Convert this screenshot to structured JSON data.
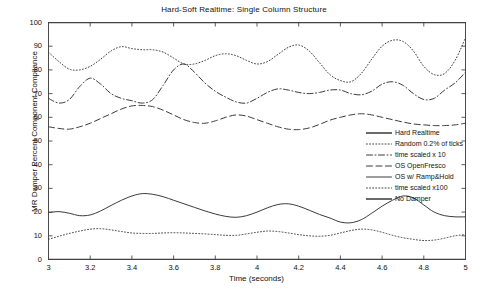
{
  "chart_data": {
    "type": "line",
    "title": "Hard-Soft Realtime: Single Column Structure",
    "xlabel": "Time (seconds)",
    "ylabel": "MR Damper Percent Component Compliance",
    "xlim": [
      3,
      5
    ],
    "ylim": [
      0,
      100
    ],
    "xticks": [
      "3",
      "3.2",
      "3.4",
      "3.6",
      "3.8",
      "4",
      "4.2",
      "4.4",
      "4.6",
      "4.8",
      "5"
    ],
    "xtick_values": [
      3,
      3.2,
      3.4,
      3.6,
      3.8,
      4,
      4.2,
      4.4,
      4.6,
      4.8,
      5
    ],
    "yticks": [
      "0",
      "10",
      "20",
      "30",
      "40",
      "50",
      "60",
      "70",
      "80",
      "90",
      "100"
    ],
    "ytick_values": [
      0,
      10,
      20,
      30,
      40,
      50,
      60,
      70,
      80,
      90,
      100
    ],
    "grid": false,
    "legend_position": "center-right",
    "x": [
      3.0,
      3.05,
      3.1,
      3.15,
      3.2,
      3.25,
      3.3,
      3.35,
      3.4,
      3.45,
      3.5,
      3.55,
      3.6,
      3.65,
      3.7,
      3.75,
      3.8,
      3.85,
      3.9,
      3.95,
      4.0,
      4.05,
      4.1,
      4.15,
      4.2,
      4.25,
      4.3,
      4.35,
      4.4,
      4.45,
      4.5,
      4.55,
      4.6,
      4.65,
      4.7,
      4.75,
      4.8,
      4.85,
      4.9,
      4.95,
      5.0
    ],
    "series": [
      {
        "name": "Hard Realtime",
        "style": "solid",
        "width": 1.6,
        "color": "#3a3a3a",
        "values": [
          100,
          100,
          100,
          100,
          100,
          100,
          100,
          100,
          100,
          100,
          100,
          100,
          100,
          100,
          100,
          100,
          100,
          100,
          100,
          100,
          100,
          100,
          100,
          100,
          100,
          100,
          100,
          100,
          100,
          100,
          100,
          100,
          100,
          100,
          100,
          100,
          100,
          100,
          100,
          100,
          100
        ]
      },
      {
        "name": "Random 0.2% of ticks",
        "style": "dotted",
        "width": 1.0,
        "color": "#3a3a3a",
        "values": [
          87.5,
          83.5,
          80.3,
          80.0,
          81.5,
          84.5,
          88.0,
          89.8,
          89.0,
          88.5,
          88.5,
          87.5,
          85.0,
          82.5,
          82.5,
          84.0,
          86.0,
          86.8,
          86.0,
          84.0,
          82.5,
          83.5,
          86.5,
          89.5,
          90.5,
          88.0,
          83.0,
          78.0,
          75.5,
          75.0,
          78.5,
          84.5,
          90.0,
          92.5,
          92.0,
          88.0,
          81.5,
          78.0,
          78.5,
          84.0,
          93.5
        ]
      },
      {
        "name": "time scaled x 10",
        "style": "dashdot",
        "width": 1.0,
        "color": "#3a3a3a",
        "values": [
          68.0,
          66.0,
          67.5,
          73.0,
          76.5,
          74.0,
          70.0,
          68.0,
          67.0,
          66.0,
          67.5,
          73.5,
          80.0,
          82.5,
          79.0,
          74.5,
          71.0,
          68.5,
          66.5,
          66.0,
          68.0,
          70.5,
          72.0,
          71.5,
          70.5,
          70.0,
          70.5,
          71.5,
          71.5,
          70.0,
          69.5,
          71.0,
          74.0,
          75.0,
          73.5,
          70.0,
          67.5,
          68.0,
          71.5,
          74.5,
          79.0
        ]
      },
      {
        "name": "OS OpenFresco",
        "style": "dashed",
        "width": 1.0,
        "color": "#3a3a3a",
        "values": [
          56.0,
          55.3,
          55.0,
          56.0,
          57.5,
          59.5,
          61.5,
          63.5,
          64.8,
          65.0,
          64.5,
          63.0,
          61.0,
          59.0,
          57.8,
          57.5,
          58.5,
          60.0,
          61.0,
          60.5,
          59.0,
          57.5,
          56.0,
          55.0,
          54.8,
          55.5,
          57.0,
          58.8,
          60.0,
          61.0,
          61.5,
          61.0,
          60.0,
          59.0,
          58.0,
          57.2,
          56.8,
          56.5,
          56.5,
          56.8,
          57.5
        ]
      },
      {
        "name": "OS w/ Ramp&Hold",
        "style": "solid",
        "width": 1.0,
        "color": "#3a3a3a",
        "values": [
          19.8,
          20.2,
          19.5,
          18.5,
          18.8,
          20.5,
          22.8,
          25.0,
          26.8,
          27.8,
          27.5,
          26.5,
          25.0,
          23.5,
          22.0,
          20.5,
          19.2,
          18.2,
          17.8,
          18.5,
          20.0,
          21.8,
          23.2,
          23.5,
          22.5,
          20.8,
          19.0,
          17.5,
          15.8,
          15.5,
          16.8,
          19.5,
          22.5,
          25.0,
          26.8,
          26.0,
          23.0,
          20.0,
          18.5,
          18.0,
          18.0
        ]
      },
      {
        "name": "time scaled x100",
        "style": "dotted",
        "width": 1.0,
        "color": "#3a3a3a",
        "values": [
          8.5,
          9.8,
          11.0,
          12.0,
          12.8,
          13.0,
          12.5,
          11.8,
          11.2,
          11.0,
          11.0,
          11.2,
          11.3,
          11.2,
          11.0,
          10.8,
          10.5,
          10.2,
          10.2,
          10.8,
          11.5,
          12.0,
          11.8,
          11.2,
          10.5,
          10.0,
          9.8,
          10.2,
          11.2,
          12.2,
          12.8,
          12.5,
          11.5,
          10.2,
          9.2,
          8.5,
          8.0,
          8.2,
          9.0,
          10.0,
          10.5
        ]
      },
      {
        "name": "No Damper",
        "style": "solid",
        "width": 1.6,
        "color": "#3a3a3a",
        "values": [
          0,
          0,
          0,
          0,
          0,
          0,
          0,
          0,
          0,
          0,
          0,
          0,
          0,
          0,
          0,
          0,
          0,
          0,
          0,
          0,
          0,
          0,
          0,
          0,
          0,
          0,
          0,
          0,
          0,
          0,
          0,
          0,
          0,
          0,
          0,
          0,
          0,
          0,
          0,
          0,
          0
        ]
      }
    ]
  },
  "axes_style": {
    "box_color": "#4a4a4a",
    "tick_color": "#4a4a4a",
    "background": "#ffffff"
  }
}
